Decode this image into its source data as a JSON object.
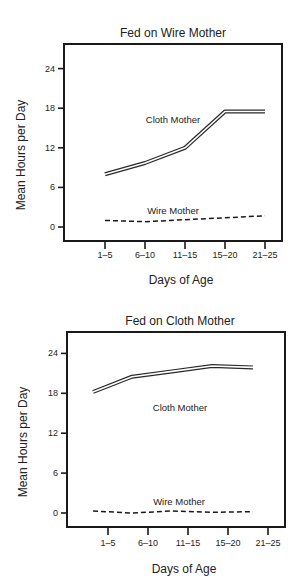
{
  "chart_data": [
    {
      "type": "line",
      "title": "Fed on Wire Mother",
      "xlabel": "Days of Age",
      "ylabel": "Mean Hours per Day",
      "categories": [
        "1–5",
        "6–10",
        "11–15",
        "15–20",
        "21–25"
      ],
      "yticks": [
        0,
        6,
        12,
        18,
        24
      ],
      "ylim": [
        0,
        24
      ],
      "grid": false,
      "series": [
        {
          "name": "Cloth Mother",
          "style": "double-line",
          "values": [
            8,
            9.7,
            12,
            17.5,
            17.5
          ]
        },
        {
          "name": "Wire Mother",
          "style": "dashed",
          "values": [
            1.0,
            0.8,
            1.1,
            1.4,
            1.7
          ]
        }
      ],
      "annotations": [
        {
          "text": "Cloth Mother",
          "near_series": "Cloth Mother"
        },
        {
          "text": "Wire Mother",
          "near_series": "Wire Mother"
        }
      ]
    },
    {
      "type": "line",
      "title": "Fed on Cloth Mother",
      "xlabel": "Days of Age",
      "ylabel": "Mean Hours per Day",
      "categories": [
        "1–5",
        "6–10",
        "11–15",
        "15–20",
        "21–25"
      ],
      "yticks": [
        0,
        6,
        12,
        18,
        24
      ],
      "ylim": [
        0,
        24
      ],
      "grid": false,
      "series": [
        {
          "name": "Cloth Mother",
          "style": "double-line",
          "values": [
            18.2,
            20.5,
            21.3,
            22.1,
            21.9
          ]
        },
        {
          "name": "Wire Mother",
          "style": "dashed",
          "values": [
            0.3,
            0.0,
            0.3,
            0.1,
            0.2
          ]
        }
      ],
      "annotations": [
        {
          "text": "Cloth Mother",
          "near_series": "Cloth Mother"
        },
        {
          "text": "Wire Mother",
          "near_series": "Wire Mother"
        }
      ]
    }
  ]
}
